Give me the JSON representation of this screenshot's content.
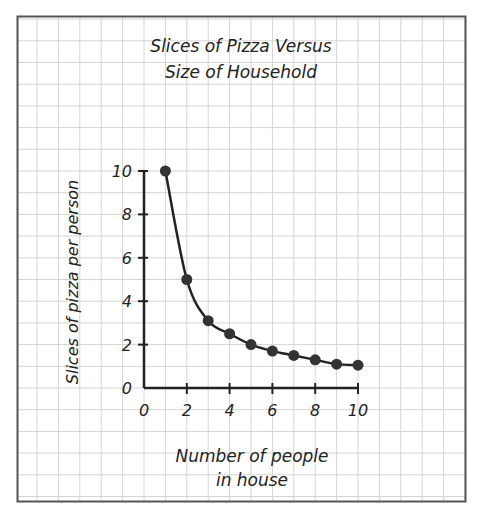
{
  "chart_data": {
    "type": "line",
    "title": "Slices of Pizza Versus Size of Household",
    "title_lines": [
      "Slices of Pizza Versus",
      "Size of Household"
    ],
    "xlabel": "Number of people in house",
    "xlabel_lines": [
      "Number of people",
      "in house"
    ],
    "ylabel": "Slices of  pizza per person",
    "x": [
      1,
      2,
      3,
      4,
      5,
      6,
      7,
      8,
      9,
      10
    ],
    "values": [
      10,
      5,
      3.1,
      2.5,
      2,
      1.7,
      1.5,
      1.3,
      1.1,
      1.05
    ],
    "series": [
      {
        "name": "Slices per person",
        "x": [
          1,
          2,
          3,
          4,
          5,
          6,
          7,
          8,
          9,
          10
        ],
        "values": [
          10,
          5,
          3.1,
          2.5,
          2,
          1.7,
          1.5,
          1.3,
          1.1,
          1.05
        ]
      }
    ],
    "xlim": [
      0,
      10
    ],
    "ylim": [
      0,
      10
    ],
    "xticks": [
      "0",
      "2",
      "4",
      "6",
      "8",
      "10"
    ],
    "yticks": [
      "0",
      "2",
      "4",
      "6",
      "8",
      "10"
    ],
    "grid": true,
    "legend": null,
    "markers": true
  },
  "colors": {
    "grid": "#d4d4d4",
    "frame": "#555555",
    "ink": "#222222",
    "point": "#333333"
  }
}
